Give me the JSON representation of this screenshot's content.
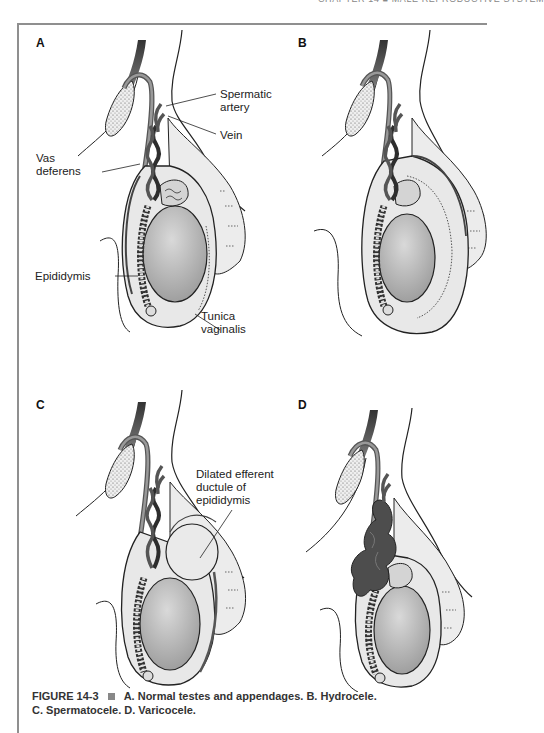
{
  "running_head": "CHAPTER 14 ■ MALE REPRODUCTIVE SYSTEM",
  "colors": {
    "frame": "#8f8f8f",
    "skin_fill": "#e6e6e6",
    "testis_fill": "#bdbdbd",
    "vessel_dark": "#3a3a3a",
    "varicocele": "#4a4a4a",
    "line": "#222222"
  },
  "panels": [
    {
      "letter": "A",
      "title": "Normal testes and appendages",
      "labels": {
        "spermatic_artery": "Spermatic\nartery",
        "spermatic_artery_l1": "Spermatic",
        "spermatic_artery_l2": "artery",
        "vein": "Vein",
        "vas_deferens_l1": "Vas",
        "vas_deferens_l2": "deferens",
        "epididymis": "Epididymis",
        "tunica_vaginalis_l1": "Tunica",
        "tunica_vaginalis_l2": "vaginalis"
      }
    },
    {
      "letter": "B",
      "title": "Hydrocele"
    },
    {
      "letter": "C",
      "title": "Spermatocele",
      "labels": {
        "dilated_l1": "Dilated efferent",
        "dilated_l2": "ductule of",
        "dilated_l3": "epididymis"
      }
    },
    {
      "letter": "D",
      "title": "Varicocele"
    }
  ],
  "caption": {
    "figure_number": "FIGURE 14-3",
    "text_line1": "A. Normal testes and appendages. B. Hydrocele.",
    "text_line2": "C. Spermatocele. D. Varicocele."
  }
}
